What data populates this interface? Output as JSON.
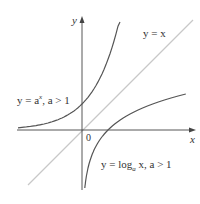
{
  "diagram": {
    "axes": {
      "x_label": "x",
      "y_label": "y",
      "origin_label": "0"
    },
    "curves": [
      {
        "id": "exp",
        "label_prefix": "y = a",
        "label_sup": "x",
        "label_suffix": ", a > 1",
        "color": "#555555"
      },
      {
        "id": "identity",
        "label": "y = x",
        "color": "#c8c8c8"
      },
      {
        "id": "log",
        "label_prefix": "y = log",
        "label_sub": "a",
        "label_suffix": " x,  a > 1",
        "color": "#555555"
      }
    ],
    "colors": {
      "axis": "#444444",
      "curve": "#555555",
      "identity_line": "#c8c8c8",
      "text": "#333333"
    }
  }
}
